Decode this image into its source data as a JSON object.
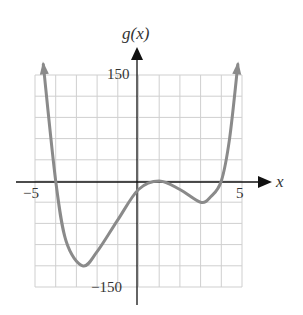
{
  "chart_data": {
    "type": "line",
    "title": "",
    "xlabel": "x",
    "ylabel": "g(x)",
    "xlim": [
      -5,
      5
    ],
    "ylim": [
      -150,
      150
    ],
    "grid": true,
    "x_tick_labels": [
      "-5",
      "5"
    ],
    "y_tick_labels": [
      "150",
      "-150"
    ],
    "x_grid_step": 1,
    "y_grid_step": 30,
    "series": [
      {
        "name": "g(x)",
        "color": "#888888",
        "x": [
          -4.6,
          -4.0,
          -3.5,
          -2.7,
          -2.0,
          -1.0,
          0.0,
          1.0,
          2.0,
          3.0,
          3.5,
          4.0,
          4.4,
          4.8
        ],
        "y": [
          165,
          0,
          -85,
          -120,
          -100,
          -55,
          -12,
          0,
          -12,
          -30,
          -22,
          0,
          60,
          165
        ]
      }
    ],
    "annotations": {
      "x_intercepts": [
        -4,
        1,
        4
      ],
      "local_min_1": [
        -2.7,
        -120
      ],
      "local_max": [
        1,
        0
      ],
      "local_min_2": [
        3,
        -30
      ]
    }
  },
  "labels": {
    "y_axis": "g(x)",
    "x_axis": "x",
    "y_top": "150",
    "y_bottom": "−150",
    "x_left": "−5",
    "x_right": "5"
  }
}
